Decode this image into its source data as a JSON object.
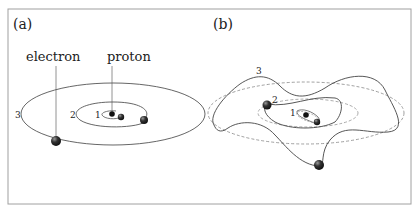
{
  "panels": [
    {
      "label": "(a)",
      "annotations": {
        "electron": "electron",
        "proton": "proton"
      },
      "orbits": [
        "1",
        "2",
        "3"
      ]
    },
    {
      "label": "(b)",
      "orbits": [
        "1",
        "2",
        "3"
      ]
    }
  ],
  "colors": {
    "frame": "#9a9a9a",
    "orbit": "#444444",
    "dashed": "#888888",
    "particle": "#222222"
  }
}
